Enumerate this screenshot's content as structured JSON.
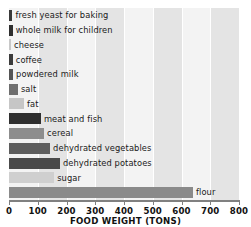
{
  "chart_data": {
    "type": "bar",
    "orientation": "horizontal",
    "title": "",
    "xlabel": "FOOD WEIGHT (TONS)",
    "ylabel": "",
    "xlim": [
      0,
      800
    ],
    "xticks": [
      0,
      100,
      200,
      300,
      400,
      500,
      600,
      700,
      800
    ],
    "xtick_labels": [
      "0",
      "100",
      "200",
      "300",
      "400",
      "500",
      "600",
      "700",
      "800"
    ],
    "grid": true,
    "legend": "none",
    "categories": [
      "fresh yeast for baking",
      "whole milk for children",
      "cheese",
      "coffee",
      "powdered milk",
      "salt",
      "fat",
      "meat and fish",
      "cereal",
      "dehydrated vegetables",
      "dehydrated potatoes",
      "sugar",
      "flour"
    ],
    "values": [
      12,
      13,
      7,
      13,
      14,
      31,
      52,
      111,
      122,
      143,
      177,
      157,
      640
    ],
    "bar_colors": [
      "#3a3a3a",
      "#2e2e2e",
      "#c8c8c8",
      "#3b3b3b",
      "#555555",
      "#6e6e6e",
      "#c6c6c6",
      "#2f2f2f",
      "#8d8d8d",
      "#5d5d5d",
      "#4a4a4a",
      "#cfcfcf",
      "#8a8a8a"
    ],
    "plot_background": "#f3f3f3",
    "grid_band_color": "#e4e4e4",
    "axis_color": "#808080",
    "text_color": "#111111"
  }
}
